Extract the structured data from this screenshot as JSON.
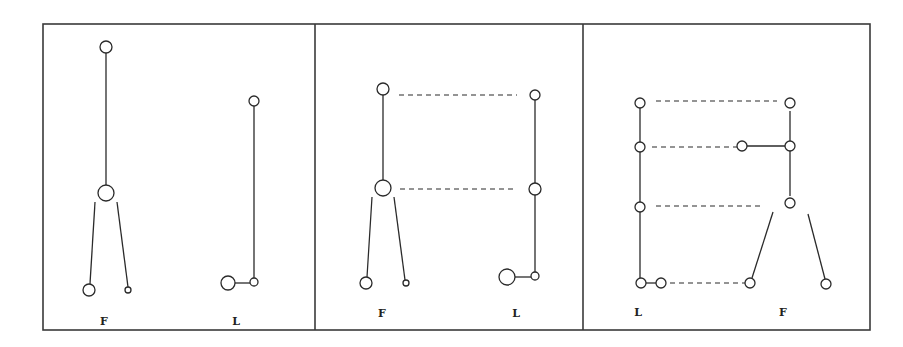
{
  "figure": {
    "panels": [
      {
        "id": "panel-1",
        "labels": [
          {
            "text": "F",
            "x": 104,
            "y": 325
          },
          {
            "text": "L",
            "x": 236,
            "y": 325
          }
        ],
        "nodes": [
          {
            "x": 106,
            "y": 47,
            "r": 6
          },
          {
            "x": 106,
            "y": 193,
            "r": 8
          },
          {
            "x": 89,
            "y": 290,
            "r": 6
          },
          {
            "x": 128,
            "y": 290,
            "r": 3
          },
          {
            "x": 254,
            "y": 101,
            "r": 5
          },
          {
            "x": 228,
            "y": 283,
            "r": 7
          },
          {
            "x": 254,
            "y": 282,
            "r": 4
          }
        ],
        "solid_lines": [
          [
            106,
            53,
            106,
            185
          ],
          [
            95,
            202,
            90,
            284
          ],
          [
            117,
            202,
            128,
            287
          ],
          [
            254,
            106,
            254,
            278
          ],
          [
            235,
            283,
            250,
            283
          ]
        ],
        "dashed_lines": []
      },
      {
        "id": "panel-2",
        "labels": [
          {
            "text": "F",
            "x": 382,
            "y": 317
          },
          {
            "text": "L",
            "x": 516,
            "y": 317
          }
        ],
        "nodes": [
          {
            "x": 383,
            "y": 89,
            "r": 6
          },
          {
            "x": 383,
            "y": 188,
            "r": 8
          },
          {
            "x": 366,
            "y": 283,
            "r": 6
          },
          {
            "x": 406,
            "y": 283,
            "r": 3
          },
          {
            "x": 535,
            "y": 95,
            "r": 5
          },
          {
            "x": 535,
            "y": 189,
            "r": 6
          },
          {
            "x": 507,
            "y": 277,
            "r": 8
          },
          {
            "x": 535,
            "y": 276,
            "r": 4
          }
        ],
        "solid_lines": [
          [
            383,
            95,
            383,
            180
          ],
          [
            372,
            197,
            367,
            277
          ],
          [
            394,
            197,
            405,
            280
          ],
          [
            535,
            100,
            535,
            272
          ],
          [
            515,
            277,
            531,
            277
          ]
        ],
        "dashed_lines": [
          [
            399,
            95,
            517,
            95
          ],
          [
            400,
            189,
            517,
            189
          ]
        ]
      },
      {
        "id": "panel-3",
        "labels": [
          {
            "text": "L",
            "x": 638,
            "y": 316
          },
          {
            "text": "F",
            "x": 783,
            "y": 316
          }
        ],
        "nodes": [
          {
            "x": 640,
            "y": 103,
            "r": 5
          },
          {
            "x": 640,
            "y": 147,
            "r": 5
          },
          {
            "x": 640,
            "y": 207,
            "r": 5
          },
          {
            "x": 641,
            "y": 283,
            "r": 5
          },
          {
            "x": 661,
            "y": 283,
            "r": 5
          },
          {
            "x": 790,
            "y": 103,
            "r": 5
          },
          {
            "x": 742,
            "y": 146,
            "r": 5
          },
          {
            "x": 790,
            "y": 146,
            "r": 5
          },
          {
            "x": 790,
            "y": 203,
            "r": 5
          },
          {
            "x": 750,
            "y": 283,
            "r": 5
          },
          {
            "x": 826,
            "y": 284,
            "r": 5
          }
        ],
        "solid_lines": [
          [
            640,
            108,
            640,
            278
          ],
          [
            646,
            283,
            656,
            283
          ],
          [
            790,
            111,
            790,
            196
          ],
          [
            747,
            146,
            785,
            146
          ],
          [
            773,
            212,
            752,
            278
          ],
          [
            808,
            214,
            825,
            279
          ]
        ],
        "dashed_lines": [
          [
            656,
            101,
            777,
            101
          ],
          [
            652,
            147,
            738,
            147
          ],
          [
            656,
            206,
            760,
            206
          ],
          [
            670,
            283,
            745,
            283
          ]
        ]
      }
    ],
    "frame": {
      "x": 43,
      "y": 24,
      "w": 827,
      "h": 306
    },
    "dividers": [
      315,
      583
    ],
    "colors": {
      "stroke": "#2a2a2a",
      "background": "#ffffff"
    }
  }
}
